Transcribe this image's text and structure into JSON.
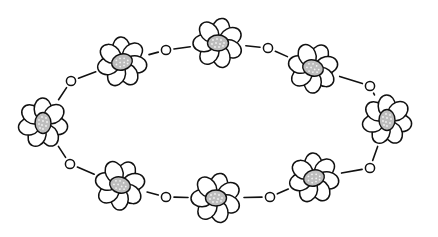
{
  "illustration": {
    "subject": "oval chain of daisy flowers linked by beads",
    "colors": {
      "background": "#ffffff",
      "stroke": "#111111",
      "petal_fill": "#ffffff",
      "center_fill": "#bdbdbd",
      "center_dots": "#f2f2f2"
    },
    "ellipse": {
      "cx": 216,
      "cy": 121,
      "rx": 174,
      "ry": 78
    },
    "flowers": [
      {
        "name": "top",
        "x": 218,
        "y": 43,
        "rot": 0
      },
      {
        "name": "upper-right",
        "x": 313,
        "y": 68,
        "rot": 15
      },
      {
        "name": "right",
        "x": 387,
        "y": 120,
        "rot": 90
      },
      {
        "name": "lower-right",
        "x": 314,
        "y": 178,
        "rot": -15
      },
      {
        "name": "bottom",
        "x": 216,
        "y": 198,
        "rot": 0
      },
      {
        "name": "lower-left",
        "x": 120,
        "y": 185,
        "rot": 15
      },
      {
        "name": "left",
        "x": 43,
        "y": 123,
        "rot": 90
      },
      {
        "name": "upper-left",
        "x": 122,
        "y": 62,
        "rot": -15
      }
    ],
    "beads": [
      {
        "x": 166,
        "y": 50
      },
      {
        "x": 268,
        "y": 48
      },
      {
        "x": 370,
        "y": 86
      },
      {
        "x": 370,
        "y": 168
      },
      {
        "x": 270,
        "y": 197
      },
      {
        "x": 166,
        "y": 197
      },
      {
        "x": 70,
        "y": 164
      },
      {
        "x": 71,
        "y": 81
      }
    ]
  }
}
